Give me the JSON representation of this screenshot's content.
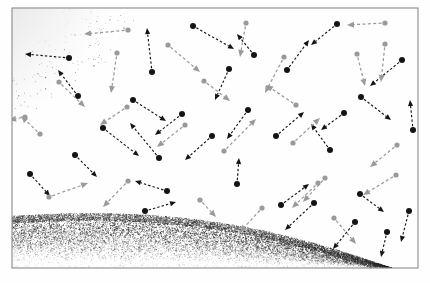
{
  "figure": {
    "frame": {
      "x": 12,
      "y": 8,
      "width": 406,
      "height": 260,
      "stroke": "#8a8a8a",
      "stroke_width": 1.1
    },
    "background_color": "#fefefe",
    "dark_color": "#141414",
    "light_color": "#9a9a9a",
    "stipple_color": "#2b2b2b"
  },
  "surfaces": [
    {
      "name": "upper-left-arc",
      "kind": "stippled-arc",
      "note": "Convex dark stippled arc entering from the top-left corner, densest near its lower-right boundary edge, fading upward and to the left.",
      "density": 0.55
    },
    {
      "name": "bottom-curved-band",
      "kind": "stippled-band",
      "note": "Wide stippled band sweeping across the bottom of the frame, crest near the left third, descending to the lower right; densest along its top boundary line and fading downward.",
      "density": 0.75
    }
  ],
  "legend": {
    "dark_particle_label": "dark particle",
    "light_particle_label": "light particle",
    "arrow_label": "velocity vector"
  },
  "chart_data": {
    "type": "scatter",
    "xlabel": "",
    "ylabel": "",
    "xlim": [
      12,
      418
    ],
    "ylim": [
      8,
      268
    ],
    "grid": false,
    "legend_position": "none",
    "series": [
      {
        "name": "dark particles",
        "color": "#141414",
        "points": [
          {
            "x": 69,
            "y": 58,
            "dx": -44,
            "dy": -4,
            "tone": "dark"
          },
          {
            "x": 152,
            "y": 72,
            "dx": -5,
            "dy": -44,
            "tone": "dark"
          },
          {
            "x": 193,
            "y": 26,
            "dx": 41,
            "dy": 23,
            "tone": "dark"
          },
          {
            "x": 229,
            "y": 69,
            "dx": -14,
            "dy": 31,
            "tone": "dark"
          },
          {
            "x": 254,
            "y": 55,
            "dx": -17,
            "dy": -21,
            "tone": "dark"
          },
          {
            "x": 287,
            "y": 70,
            "dx": 22,
            "dy": -30,
            "tone": "dark"
          },
          {
            "x": 337,
            "y": 24,
            "dx": -26,
            "dy": 21,
            "tone": "dark"
          },
          {
            "x": 402,
            "y": 60,
            "dx": -32,
            "dy": 26,
            "tone": "dark"
          },
          {
            "x": 78,
            "y": 96,
            "dx": -20,
            "dy": -26,
            "tone": "dark"
          },
          {
            "x": 133,
            "y": 100,
            "dx": 33,
            "dy": 21,
            "tone": "dark"
          },
          {
            "x": 182,
            "y": 114,
            "dx": -27,
            "dy": 21,
            "tone": "dark"
          },
          {
            "x": 248,
            "y": 110,
            "dx": -21,
            "dy": 29,
            "tone": "dark"
          },
          {
            "x": 361,
            "y": 97,
            "dx": 30,
            "dy": 23,
            "tone": "dark"
          },
          {
            "x": 413,
            "y": 130,
            "dx": -3,
            "dy": -30,
            "tone": "dark"
          },
          {
            "x": 75,
            "y": 155,
            "dx": 22,
            "dy": 22,
            "tone": "dark"
          },
          {
            "x": 103,
            "y": 128,
            "dx": 36,
            "dy": 28,
            "tone": "dark"
          },
          {
            "x": 159,
            "y": 158,
            "dx": -29,
            "dy": -35,
            "tone": "dark"
          },
          {
            "x": 212,
            "y": 136,
            "dx": -27,
            "dy": 24,
            "tone": "dark"
          },
          {
            "x": 276,
            "y": 136,
            "dx": 28,
            "dy": -24,
            "tone": "dark"
          },
          {
            "x": 330,
            "y": 150,
            "dx": -19,
            "dy": -26,
            "tone": "dark"
          },
          {
            "x": 344,
            "y": 113,
            "dx": -23,
            "dy": 17,
            "tone": "dark"
          },
          {
            "x": 237,
            "y": 184,
            "dx": 2,
            "dy": -26,
            "tone": "dark"
          },
          {
            "x": 30,
            "y": 174,
            "dx": 20,
            "dy": 22,
            "tone": "dark"
          },
          {
            "x": 167,
            "y": 191,
            "dx": -32,
            "dy": -10,
            "tone": "dark"
          },
          {
            "x": 145,
            "y": 211,
            "dx": 31,
            "dy": -9,
            "tone": "dark"
          },
          {
            "x": 281,
            "y": 205,
            "dx": 28,
            "dy": -21,
            "tone": "dark"
          },
          {
            "x": 314,
            "y": 203,
            "dx": -29,
            "dy": 27,
            "tone": "dark"
          },
          {
            "x": 355,
            "y": 222,
            "dx": -22,
            "dy": 27,
            "tone": "dark"
          },
          {
            "x": 360,
            "y": 194,
            "dx": 24,
            "dy": 18,
            "tone": "dark"
          },
          {
            "x": 409,
            "y": 211,
            "dx": -8,
            "dy": 31,
            "tone": "dark"
          },
          {
            "x": 387,
            "y": 232,
            "dx": -6,
            "dy": 25,
            "tone": "dark"
          }
        ]
      },
      {
        "name": "light particles",
        "color": "#9a9a9a",
        "points": [
          {
            "x": 128,
            "y": 30,
            "dx": -44,
            "dy": 4,
            "tone": "light"
          },
          {
            "x": 117,
            "y": 53,
            "dx": -6,
            "dy": 40,
            "tone": "light"
          },
          {
            "x": 246,
            "y": 23,
            "dx": -6,
            "dy": 34,
            "tone": "light"
          },
          {
            "x": 385,
            "y": 23,
            "dx": -38,
            "dy": 2,
            "tone": "light"
          },
          {
            "x": 385,
            "y": 44,
            "dx": -4,
            "dy": 38,
            "tone": "light"
          },
          {
            "x": 168,
            "y": 45,
            "dx": 32,
            "dy": 27,
            "tone": "light"
          },
          {
            "x": 59,
            "y": 82,
            "dx": 26,
            "dy": 25,
            "tone": "light"
          },
          {
            "x": 357,
            "y": 54,
            "dx": 8,
            "dy": 32,
            "tone": "light"
          },
          {
            "x": 284,
            "y": 57,
            "dx": -19,
            "dy": 36,
            "tone": "light"
          },
          {
            "x": 25,
            "y": 117,
            "dx": -16,
            "dy": 3,
            "tone": "light"
          },
          {
            "x": 296,
            "y": 105,
            "dx": -30,
            "dy": -20,
            "tone": "light"
          },
          {
            "x": 40,
            "y": 134,
            "dx": -19,
            "dy": -18,
            "tone": "light"
          },
          {
            "x": 127,
            "y": 107,
            "dx": -27,
            "dy": 18,
            "tone": "light"
          },
          {
            "x": 185,
            "y": 125,
            "dx": -28,
            "dy": 22,
            "tone": "light"
          },
          {
            "x": 224,
            "y": 151,
            "dx": 32,
            "dy": -32,
            "tone": "light"
          },
          {
            "x": 293,
            "y": 143,
            "dx": 27,
            "dy": -25,
            "tone": "light"
          },
          {
            "x": 397,
            "y": 145,
            "dx": -27,
            "dy": 22,
            "tone": "light"
          },
          {
            "x": 49,
            "y": 197,
            "dx": 39,
            "dy": -14,
            "tone": "light"
          },
          {
            "x": 128,
            "y": 181,
            "dx": -25,
            "dy": 26,
            "tone": "light"
          },
          {
            "x": 200,
            "y": 200,
            "dx": 16,
            "dy": 17,
            "tone": "light"
          },
          {
            "x": 262,
            "y": 208,
            "dx": -22,
            "dy": 24,
            "tone": "light"
          },
          {
            "x": 318,
            "y": 183,
            "dx": -26,
            "dy": 25,
            "tone": "light"
          },
          {
            "x": 334,
            "y": 218,
            "dx": 22,
            "dy": 26,
            "tone": "light"
          },
          {
            "x": 396,
            "y": 175,
            "dx": -33,
            "dy": 20,
            "tone": "light"
          },
          {
            "x": 204,
            "y": 81,
            "dx": 26,
            "dy": 20,
            "tone": "light"
          },
          {
            "x": 325,
            "y": 178,
            "dx": -22,
            "dy": 24,
            "tone": "light"
          }
        ]
      }
    ]
  }
}
